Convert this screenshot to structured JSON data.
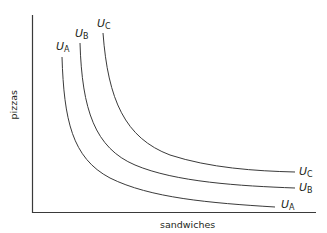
{
  "diagram": {
    "type": "indifference-curves",
    "x_axis_label": "sandwiches",
    "y_axis_label": "pizzas",
    "colors": {
      "line": "#3a3a3a",
      "text": "#231f20",
      "background": "#ffffff"
    },
    "curves": [
      {
        "id": "A",
        "label_main": "U",
        "label_sub": "A"
      },
      {
        "id": "B",
        "label_main": "U",
        "label_sub": "B"
      },
      {
        "id": "C",
        "label_main": "U",
        "label_sub": "C"
      }
    ]
  }
}
